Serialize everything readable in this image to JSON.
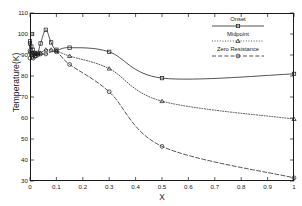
{
  "chart_data": {
    "type": "line",
    "title": "",
    "xlabel": "X",
    "ylabel": "Temperature(K)",
    "xlim": [
      0,
      1
    ],
    "ylim": [
      30,
      110
    ],
    "xticks": [
      0,
      0.1,
      0.2,
      0.3,
      0.4,
      0.5,
      0.6,
      0.7,
      0.8,
      0.9,
      1
    ],
    "xtick_labels": [
      "0",
      "0.1",
      "0.2",
      "0.3",
      "0.4",
      "0.5",
      "0.6",
      "0.7",
      "0.8",
      "0.9",
      "1"
    ],
    "yticks": [
      30,
      40,
      50,
      60,
      70,
      80,
      90,
      100,
      110
    ],
    "ytick_labels": [
      "30",
      "40",
      "50",
      "60",
      "70",
      "80",
      "90",
      "100",
      "110"
    ],
    "grid": false,
    "legend_position": "upper right inside",
    "series": [
      {
        "name": "Onset",
        "marker": "square",
        "linestyle": "solid",
        "color": "#1a1a1a",
        "x": [
          0.0,
          0.005,
          0.01,
          0.015,
          0.02,
          0.03,
          0.04,
          0.06,
          0.08,
          0.1,
          0.15,
          0.3,
          0.5,
          1.0
        ],
        "y": [
          95.5,
          94.0,
          92.5,
          91.0,
          90.5,
          91.0,
          95.5,
          102.0,
          96.0,
          92.5,
          93.5,
          91.5,
          79.0,
          81.0
        ]
      },
      {
        "name": "Midpoint",
        "marker": "triangle",
        "linestyle": "dotted",
        "color": "#1a1a1a",
        "x": [
          0.0,
          0.01,
          0.02,
          0.03,
          0.04,
          0.06,
          0.08,
          0.1,
          0.15,
          0.3,
          0.5,
          1.0
        ],
        "y": [
          91.5,
          91.0,
          90.5,
          90.5,
          91.0,
          92.5,
          92.5,
          92.0,
          89.5,
          83.5,
          68.0,
          59.5
        ]
      },
      {
        "name": "Zero Resistance",
        "marker": "circle",
        "linestyle": "dashed",
        "color": "#1a1a1a",
        "x": [
          0.0,
          0.005,
          0.01,
          0.02,
          0.03,
          0.04,
          0.06,
          0.1,
          0.15,
          0.3,
          0.5,
          1.0
        ],
        "y": [
          92.0,
          90.0,
          89.0,
          89.5,
          90.0,
          90.5,
          90.5,
          91.5,
          85.5,
          72.5,
          46.5,
          31.5
        ]
      }
    ],
    "extra_points": [
      {
        "series": "Onset",
        "x": 0.008,
        "y": 100.0,
        "marker": "square"
      },
      {
        "series": "Onset",
        "x": 0.0,
        "y": 96.5,
        "marker": "square"
      },
      {
        "series": "Onset",
        "x": 0.02,
        "y": 89.5,
        "marker": "square"
      },
      {
        "series": "Zero Resistance",
        "x": 0.0,
        "y": 88.5,
        "marker": "circle"
      },
      {
        "series": "Zero Resistance",
        "x": 0.012,
        "y": 88.5,
        "marker": "circle"
      }
    ]
  },
  "legend": {
    "entries": [
      {
        "label": "Onset"
      },
      {
        "label": "Midpoint"
      },
      {
        "label": "Zero Resistance"
      }
    ]
  },
  "axes": {
    "x_title": "X",
    "y_title": "Temperature(K)"
  },
  "style": {
    "foreground": "#1a1a1a",
    "background": "#ffffff"
  }
}
